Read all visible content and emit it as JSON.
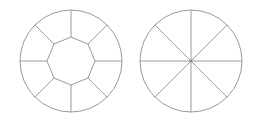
{
  "canvas": {
    "width": 263,
    "height": 124,
    "background": "#ffffff"
  },
  "stroke_color": "#9a9a9a",
  "figures": [
    {
      "name": "ring-with-octagon",
      "cx": 71,
      "cy": 61,
      "outer_r": 51,
      "inner_r": 24,
      "segments": 8,
      "description": "Circle divided into 8 outer ring segments around a central octagon"
    },
    {
      "name": "circle-8-sectors",
      "cx": 191,
      "cy": 61,
      "r": 51,
      "segments": 8,
      "description": "Circle divided into 8 equal sectors by diameters"
    }
  ]
}
